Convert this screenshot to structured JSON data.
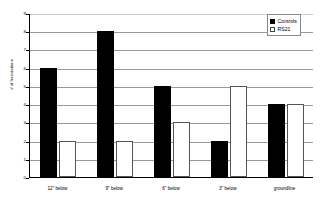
{
  "chart_data": {
    "type": "bar",
    "title": "",
    "subtitle": "",
    "xlabel": "",
    "ylabel": "# of Inundations",
    "categories": [
      "12\" below",
      "9\" below",
      "6\" below",
      "3\" below",
      "groundline"
    ],
    "series": [
      {
        "name": "Controls",
        "values": [
          6,
          8,
          5,
          2,
          4
        ],
        "color": "#000000",
        "fill": "solid"
      },
      {
        "name": "RS21",
        "values": [
          2,
          2,
          3,
          5,
          4
        ],
        "color": "#ffffff",
        "fill": "hollow"
      }
    ],
    "ylim": [
      0,
      9
    ],
    "ytick_labels": [
      "0",
      "1",
      "2",
      "3",
      "4",
      "5",
      "6",
      "7",
      "8",
      "9"
    ],
    "ytick_values": [
      0,
      1,
      2,
      3,
      4,
      5,
      6,
      7,
      8,
      9
    ],
    "grid": "horizontal",
    "grid_color": "#9a9a9a",
    "legend_position": "top-right",
    "legend_entries": [
      "Controls",
      "RS21"
    ],
    "background": "#ffffff",
    "axis_color": "#000000"
  },
  "legend": {
    "items": [
      {
        "label": "Controls",
        "swatch": "filled-square-icon"
      },
      {
        "label": "RS21",
        "swatch": "hollow-square-icon"
      }
    ]
  },
  "axes": {
    "y_title": "# of Inundations"
  }
}
